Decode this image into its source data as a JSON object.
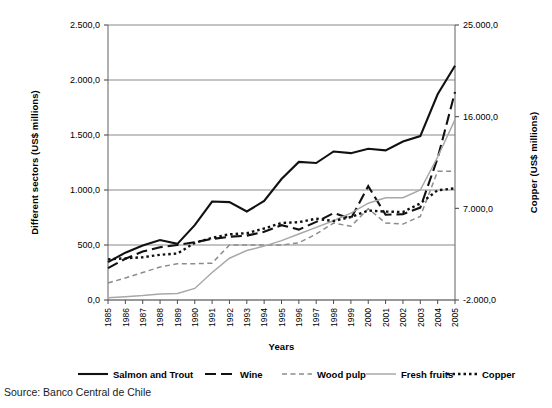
{
  "source": {
    "label": "Source: Banco Central de Chile"
  },
  "chart_data": {
    "type": "line",
    "title": "",
    "xlabel": "Years",
    "ylabel": "Different sectors (US$ millions)",
    "y2label": "Copper (US$ millions)",
    "grid": true,
    "legend_position": "bottom",
    "categories": [
      "1985",
      "1986",
      "1987",
      "1988",
      "1989",
      "1990",
      "1991",
      "1992",
      "1993",
      "1994",
      "1995",
      "1996",
      "1997",
      "1998",
      "1999",
      "2000",
      "2001",
      "2002",
      "2003",
      "2004",
      "2005"
    ],
    "ylim": [
      0,
      2500
    ],
    "yticks": [
      "0,0",
      "500,0",
      "1.000,0",
      "1.500,0",
      "2.000,0",
      "2.500,0"
    ],
    "ytick_values": [
      0,
      500,
      1000,
      1500,
      2000,
      2500
    ],
    "y2lim": [
      -2000,
      25000
    ],
    "y2ticks": [
      "-2.000,0",
      "7.000,0",
      "16.000,0",
      "25.000,0"
    ],
    "y2tick_values": [
      -2000,
      7000,
      16000,
      25000
    ],
    "series": [
      {
        "name": "Salmon and Trout",
        "axis": "left",
        "color": "#111111",
        "style": "solid",
        "width": 2.1,
        "values": [
          345,
          430,
          495,
          545,
          510,
          680,
          895,
          890,
          805,
          900,
          1100,
          1255,
          1245,
          1350,
          1335,
          1375,
          1360,
          1440,
          1490,
          1870,
          2130
        ]
      },
      {
        "name": "Wine",
        "axis": "left",
        "color": "#111111",
        "style": "dashed",
        "width": 2.1,
        "values": [
          290,
          375,
          440,
          480,
          500,
          525,
          555,
          575,
          585,
          620,
          680,
          640,
          710,
          790,
          740,
          1035,
          775,
          780,
          840,
          1290,
          1890
        ]
      },
      {
        "name": "Wood pulp",
        "axis": "left",
        "color": "#8c8c8c",
        "style": "dotted-dash",
        "width": 1.5,
        "values": [
          155,
          200,
          250,
          300,
          330,
          330,
          335,
          500,
          500,
          500,
          500,
          520,
          600,
          700,
          670,
          830,
          700,
          690,
          760,
          1170,
          1170
        ]
      },
      {
        "name": "Fresh fruits",
        "axis": "left",
        "color": "#a8a8a8",
        "style": "solid",
        "width": 1.5,
        "values": [
          20,
          30,
          40,
          55,
          60,
          105,
          250,
          380,
          450,
          490,
          540,
          600,
          660,
          720,
          790,
          880,
          930,
          930,
          1000,
          1300,
          1640
        ]
      },
      {
        "name": "Copper",
        "axis": "right",
        "color": "#111111",
        "style": "dotted",
        "width": 2.4,
        "values": [
          1990,
          2090,
          2200,
          2440,
          2560,
          3610,
          4100,
          4450,
          4560,
          5020,
          5560,
          5640,
          5980,
          5750,
          6150,
          6780,
          6680,
          6640,
          7480,
          8780,
          8960
        ]
      }
    ],
    "legend": [
      {
        "label": "Salmon and Trout",
        "style": "solid",
        "color": "#111111",
        "width": 2.1
      },
      {
        "label": "Wine",
        "style": "dashed",
        "color": "#111111",
        "width": 2.1
      },
      {
        "label": "Wood pulp",
        "style": "dotted-dash",
        "color": "#8c8c8c",
        "width": 1.5
      },
      {
        "label": "Fresh fruits",
        "style": "solid",
        "color": "#a8a8a8",
        "width": 1.5
      },
      {
        "label": "Copper",
        "style": "dotted",
        "color": "#111111",
        "width": 2.4
      }
    ]
  }
}
